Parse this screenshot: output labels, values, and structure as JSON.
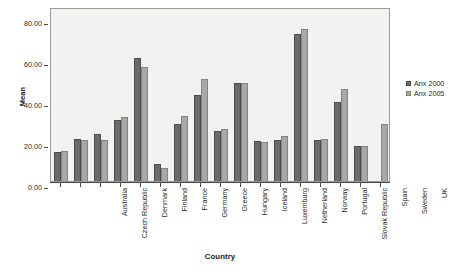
{
  "chart_data": {
    "type": "bar",
    "title": "",
    "subtitle": "",
    "xlabel": "Country",
    "ylabel": "Mean",
    "ylim": [
      0,
      85
    ],
    "grid": false,
    "legend_position": "right",
    "y_ticks": [
      "0.00",
      "20.00",
      "40.00",
      "60.00",
      "80.00"
    ],
    "y_tick_values": [
      0,
      20,
      40,
      60,
      80
    ],
    "categories": [
      "Australia",
      "Czech Republic",
      "Denmark",
      "Finland",
      "France",
      "Germany",
      "Greece",
      "Hungary",
      "Iceland",
      "Luxemburg",
      "Netherland",
      "Norway",
      "Portugal",
      "Slovak Republic",
      "Spain",
      "Sweden",
      "UK"
    ],
    "series": [
      {
        "name": "Anx 2000",
        "color": "#6b6b6b",
        "values": [
          14.0,
          20.5,
          23.0,
          30.0,
          60.3,
          8.2,
          28.0,
          42.0,
          24.5,
          48.0,
          19.5,
          20.0,
          72.0,
          20.0,
          38.5,
          17.0,
          null
        ]
      },
      {
        "name": "Anx 2005",
        "color": "#a8a8a8",
        "values": [
          14.8,
          20.0,
          20.0,
          31.2,
          55.6,
          6.3,
          32.0,
          50.0,
          25.5,
          48.0,
          19.0,
          22.0,
          74.5,
          20.5,
          45.0,
          17.0,
          28.0
        ]
      }
    ]
  },
  "legend": {
    "items": [
      {
        "label": "Anx 2000",
        "color": "#6b6b6b"
      },
      {
        "label": "Anx 2005",
        "color": "#a8a8a8"
      }
    ]
  }
}
